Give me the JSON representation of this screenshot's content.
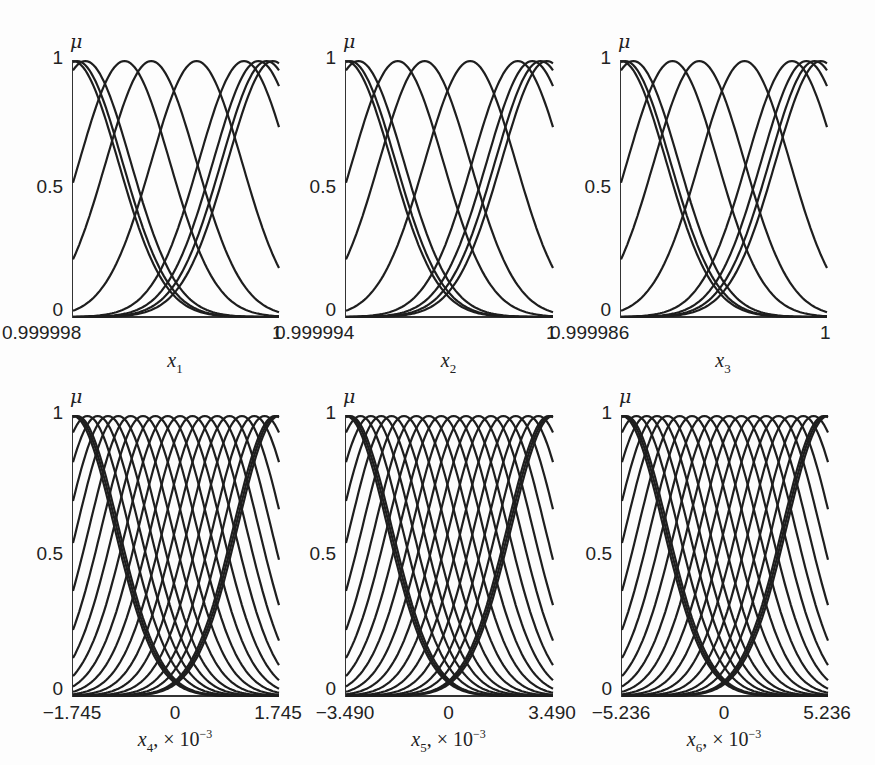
{
  "figure": {
    "panels": [
      {
        "id": "x1",
        "ylabel": "μ",
        "yticks": [
          "0",
          "0.5",
          "1"
        ],
        "xticks": [
          "0.999998",
          "1"
        ],
        "xlabel_var": "x",
        "xlabel_sub": "1",
        "xlabel_scale": "",
        "xlabel_exp": ""
      },
      {
        "id": "x2",
        "ylabel": "μ",
        "yticks": [
          "0",
          "0.5",
          "1"
        ],
        "xticks": [
          "0.999994",
          "1"
        ],
        "xlabel_var": "x",
        "xlabel_sub": "2",
        "xlabel_scale": "",
        "xlabel_exp": ""
      },
      {
        "id": "x3",
        "ylabel": "μ",
        "yticks": [
          "0",
          "0.5",
          "1"
        ],
        "xticks": [
          "0.999986",
          "1"
        ],
        "xlabel_var": "x",
        "xlabel_sub": "3",
        "xlabel_scale": "",
        "xlabel_exp": ""
      },
      {
        "id": "x4",
        "ylabel": "μ",
        "yticks": [
          "0",
          "0.5",
          "1"
        ],
        "xticks": [
          "−1.745",
          "0",
          "1.745"
        ],
        "xlabel_var": "x",
        "xlabel_sub": "4",
        "xlabel_scale": ", × 10",
        "xlabel_exp": "−3"
      },
      {
        "id": "x5",
        "ylabel": "μ",
        "yticks": [
          "0",
          "0.5",
          "1"
        ],
        "xticks": [
          "−3.490",
          "0",
          "3.490"
        ],
        "xlabel_var": "x",
        "xlabel_sub": "5",
        "xlabel_scale": ", × 10",
        "xlabel_exp": "−3"
      },
      {
        "id": "x6",
        "ylabel": "μ",
        "yticks": [
          "0",
          "0.5",
          "1"
        ],
        "xticks": [
          "−5.236",
          "0",
          "5.236"
        ],
        "xlabel_var": "x",
        "xlabel_sub": "6",
        "xlabel_scale": ", × 10",
        "xlabel_exp": "−3"
      }
    ]
  },
  "chart_data": [
    {
      "type": "line",
      "title": "",
      "xlabel": "x_1",
      "ylabel": "μ",
      "xlim": [
        0.999998,
        1
      ],
      "ylim": [
        0,
        1
      ],
      "grid": false,
      "legend": "none",
      "description": "Gaussian membership functions",
      "centers_frac": [
        0.0,
        0.02,
        0.06,
        0.25,
        0.38,
        0.6,
        0.83,
        0.9,
        0.94,
        0.97
      ],
      "sigma_frac": 0.22
    },
    {
      "type": "line",
      "title": "",
      "xlabel": "x_2",
      "ylabel": "μ",
      "xlim": [
        0.999994,
        1
      ],
      "ylim": [
        0,
        1
      ],
      "grid": false,
      "legend": "none",
      "description": "Gaussian membership functions",
      "centers_frac": [
        0.0,
        0.02,
        0.06,
        0.25,
        0.38,
        0.6,
        0.83,
        0.9,
        0.94,
        0.97
      ],
      "sigma_frac": 0.22
    },
    {
      "type": "line",
      "title": "",
      "xlabel": "x_3",
      "ylabel": "μ",
      "xlim": [
        0.999986,
        1
      ],
      "ylim": [
        0,
        1
      ],
      "grid": false,
      "legend": "none",
      "description": "Gaussian membership functions",
      "centers_frac": [
        0.0,
        0.02,
        0.06,
        0.25,
        0.38,
        0.6,
        0.83,
        0.9,
        0.94,
        0.97
      ],
      "sigma_frac": 0.22
    },
    {
      "type": "line",
      "title": "",
      "xlabel": "x_4, ×10^-3",
      "ylabel": "μ",
      "xlim": [
        -1.745,
        1.745
      ],
      "ylim": [
        0,
        1
      ],
      "grid": false,
      "legend": "none",
      "xticks": [
        -1.745,
        0,
        1.745
      ],
      "description": "Gaussian membership functions",
      "centers_frac": [
        0.0,
        0.01,
        0.02,
        0.07,
        0.12,
        0.17,
        0.22,
        0.28,
        0.34,
        0.4,
        0.46,
        0.52,
        0.58,
        0.64,
        0.7,
        0.76,
        0.82,
        0.88,
        0.93,
        0.98,
        0.99,
        1.0
      ],
      "sigma_frac": 0.2
    },
    {
      "type": "line",
      "title": "",
      "xlabel": "x_5, ×10^-3",
      "ylabel": "μ",
      "xlim": [
        -3.49,
        3.49
      ],
      "ylim": [
        0,
        1
      ],
      "grid": false,
      "legend": "none",
      "xticks": [
        -3.49,
        0,
        3.49
      ],
      "description": "Gaussian membership functions",
      "centers_frac": [
        0.0,
        0.01,
        0.02,
        0.07,
        0.12,
        0.17,
        0.22,
        0.28,
        0.34,
        0.4,
        0.46,
        0.52,
        0.58,
        0.64,
        0.7,
        0.76,
        0.82,
        0.88,
        0.93,
        0.98,
        0.99,
        1.0
      ],
      "sigma_frac": 0.2
    },
    {
      "type": "line",
      "title": "",
      "xlabel": "x_6, ×10^-3",
      "ylabel": "μ",
      "xlim": [
        -5.236,
        5.236
      ],
      "ylim": [
        0,
        1
      ],
      "grid": false,
      "legend": "none",
      "xticks": [
        -5.236,
        0,
        5.236
      ],
      "description": "Gaussian membership functions",
      "centers_frac": [
        0.0,
        0.01,
        0.02,
        0.07,
        0.12,
        0.17,
        0.22,
        0.28,
        0.34,
        0.4,
        0.46,
        0.52,
        0.58,
        0.64,
        0.7,
        0.76,
        0.82,
        0.88,
        0.93,
        0.98,
        0.99,
        1.0
      ],
      "sigma_frac": 0.2
    }
  ]
}
